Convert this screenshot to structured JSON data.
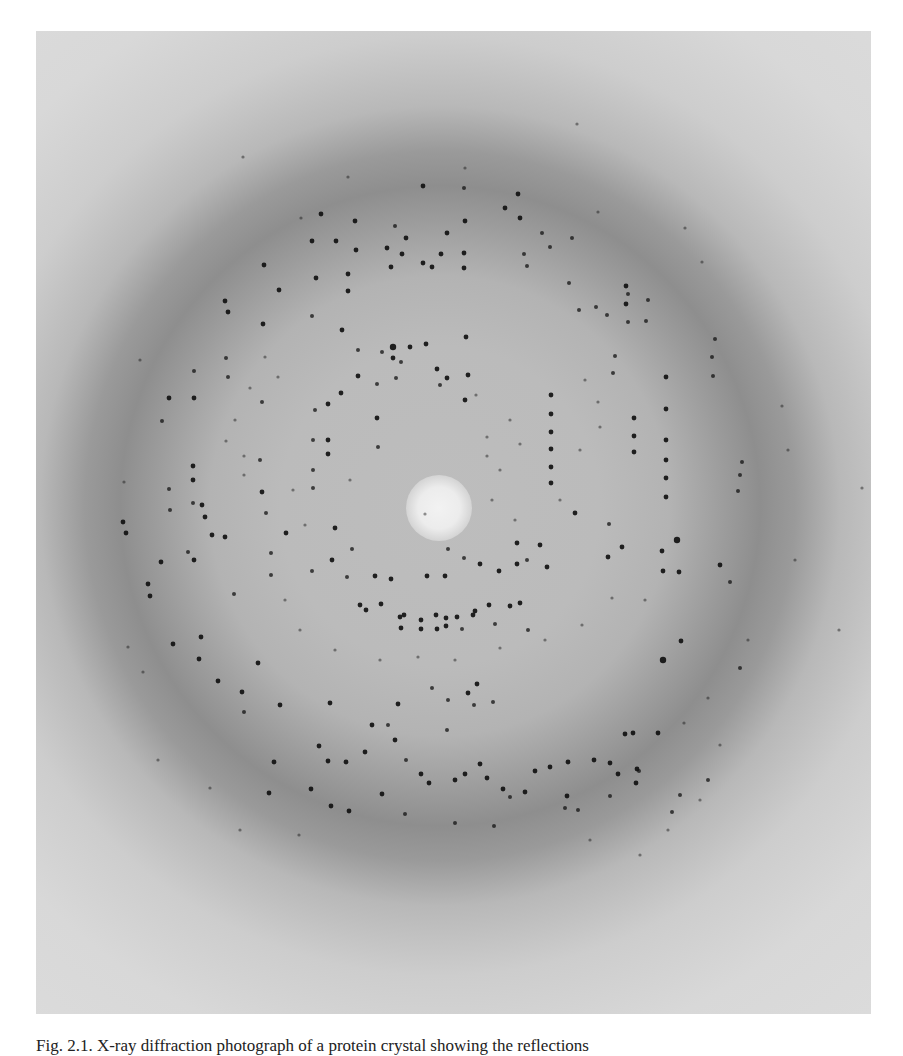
{
  "figure": {
    "kind": "x-ray-diffraction-photograph",
    "background_colors": {
      "paper": "#ffffff",
      "outer": "#dcdcdc",
      "ring": "#8e8e8e",
      "inner": "#bcbcbc",
      "beamstop": "#f0f0f0",
      "spot": "#111111"
    },
    "center": [
      404,
      475
    ]
  },
  "caption": {
    "text": "Fig. 2.1. X-ray diffraction photograph of a protein crystal showing the reflections"
  },
  "spots": [
    [
      393,
      347,
      4
    ],
    [
      393,
      358,
      3
    ],
    [
      358,
      376,
      3
    ],
    [
      341,
      393,
      3
    ],
    [
      328,
      404,
      3
    ],
    [
      328,
      440,
      3
    ],
    [
      328,
      454,
      3
    ],
    [
      410,
      347,
      3
    ],
    [
      426,
      344,
      3
    ],
    [
      437,
      369,
      3
    ],
    [
      447,
      378,
      3
    ],
    [
      440,
      385,
      2.5
    ],
    [
      466,
      337,
      3
    ],
    [
      468,
      375,
      3
    ],
    [
      465,
      400,
      3
    ],
    [
      382,
      352,
      2.5
    ],
    [
      377,
      384,
      2.5
    ],
    [
      377,
      418,
      3
    ],
    [
      378,
      447,
      2.5
    ],
    [
      315,
      410,
      2.5
    ],
    [
      313,
      440,
      2.5
    ],
    [
      313,
      470,
      2.5
    ],
    [
      313,
      488,
      2.5
    ],
    [
      401,
      362,
      2.5
    ],
    [
      396,
      378,
      2.5
    ],
    [
      551,
      395,
      3
    ],
    [
      551,
      414,
      3
    ],
    [
      551,
      432,
      3
    ],
    [
      551,
      449,
      3
    ],
    [
      551,
      467,
      3
    ],
    [
      551,
      483,
      3
    ],
    [
      634,
      418,
      3
    ],
    [
      634,
      436,
      3
    ],
    [
      634,
      452,
      3
    ],
    [
      666,
      377,
      3
    ],
    [
      666,
      409,
      3
    ],
    [
      666,
      440,
      3
    ],
    [
      666,
      460,
      3
    ],
    [
      666,
      478,
      3
    ],
    [
      666,
      497,
      3
    ],
    [
      740,
      475,
      2.5
    ],
    [
      738,
      491,
      2.5
    ],
    [
      742,
      462,
      2.5
    ],
    [
      596,
      307,
      2.5
    ],
    [
      628,
      294,
      2.5
    ],
    [
      628,
      322,
      2.5
    ],
    [
      715,
      339,
      2.5
    ],
    [
      712,
      357,
      2.5
    ],
    [
      713,
      376,
      2.5
    ],
    [
      615,
      356,
      2.5
    ],
    [
      613,
      373,
      2.5
    ],
    [
      646,
      321,
      2.5
    ],
    [
      648,
      300,
      2.5
    ],
    [
      355,
      221,
      3
    ],
    [
      395,
      226,
      2.5
    ],
    [
      423,
      186,
      3
    ],
    [
      464,
      188,
      2.5
    ],
    [
      321,
      214,
      3
    ],
    [
      312,
      241,
      3
    ],
    [
      336,
      241,
      3
    ],
    [
      356,
      250,
      3
    ],
    [
      387,
      248,
      3
    ],
    [
      402,
      254,
      3
    ],
    [
      406,
      238,
      3
    ],
    [
      423,
      263,
      3
    ],
    [
      441,
      254,
      3
    ],
    [
      432,
      267,
      3
    ],
    [
      447,
      233,
      3
    ],
    [
      464,
      253,
      3
    ],
    [
      464,
      268,
      3
    ],
    [
      391,
      267,
      3
    ],
    [
      465,
      221,
      3
    ],
    [
      520,
      218,
      3
    ],
    [
      518,
      194,
      3
    ],
    [
      542,
      233,
      2.5
    ],
    [
      550,
      247,
      2.5
    ],
    [
      505,
      208,
      3
    ],
    [
      524,
      254,
      2.5
    ],
    [
      572,
      238,
      2.5
    ],
    [
      527,
      266,
      2.5
    ],
    [
      569,
      283,
      2.5
    ],
    [
      264,
      265,
      3
    ],
    [
      225,
      301,
      3
    ],
    [
      279,
      290,
      3
    ],
    [
      316,
      278,
      3
    ],
    [
      348,
      274,
      3
    ],
    [
      348,
      291,
      3
    ],
    [
      228,
      312,
      3
    ],
    [
      263,
      324,
      3
    ],
    [
      312,
      316,
      2.5
    ],
    [
      342,
      330,
      3
    ],
    [
      358,
      350,
      2.5
    ],
    [
      626,
      286,
      3
    ],
    [
      626,
      304,
      3
    ],
    [
      607,
      315,
      2.5
    ],
    [
      579,
      310,
      2.5
    ],
    [
      194,
      371,
      2.5
    ],
    [
      194,
      398,
      3
    ],
    [
      169,
      398,
      3
    ],
    [
      162,
      421,
      2.5
    ],
    [
      226,
      358,
      2.5
    ],
    [
      228,
      377,
      2.5
    ],
    [
      262,
      402,
      2.5
    ],
    [
      193,
      466,
      3
    ],
    [
      193,
      480,
      3
    ],
    [
      193,
      503,
      2.5
    ],
    [
      169,
      489,
      2.5
    ],
    [
      170,
      510,
      2.5
    ],
    [
      202,
      505,
      3
    ],
    [
      205,
      517,
      3
    ],
    [
      260,
      460,
      2.5
    ],
    [
      262,
      492,
      3
    ],
    [
      266,
      513,
      2.5
    ],
    [
      123,
      522,
      3
    ],
    [
      126,
      533,
      3
    ],
    [
      148,
      584,
      3
    ],
    [
      150,
      596,
      3
    ],
    [
      161,
      562,
      3
    ],
    [
      194,
      560,
      3
    ],
    [
      212,
      535,
      3
    ],
    [
      234,
      594,
      2.5
    ],
    [
      271,
      553,
      2.5
    ],
    [
      271,
      575,
      2.5
    ],
    [
      188,
      552,
      2.5
    ],
    [
      225,
      537,
      3
    ],
    [
      286,
      533,
      3
    ],
    [
      335,
      528,
      3
    ],
    [
      352,
      549,
      2.5
    ],
    [
      332,
      560,
      3
    ],
    [
      312,
      571,
      2.5
    ],
    [
      347,
      577,
      2.5
    ],
    [
      375,
      576,
      3
    ],
    [
      391,
      579,
      3
    ],
    [
      427,
      576,
      3
    ],
    [
      445,
      576,
      3
    ],
    [
      480,
      564,
      3
    ],
    [
      517,
      564,
      3
    ],
    [
      527,
      560,
      2.5
    ],
    [
      540,
      545,
      3
    ],
    [
      547,
      567,
      3
    ],
    [
      517,
      543,
      3
    ],
    [
      464,
      558,
      2.5
    ],
    [
      448,
      549,
      2.5
    ],
    [
      499,
      571,
      3
    ],
    [
      360,
      605,
      3
    ],
    [
      366,
      610,
      3
    ],
    [
      381,
      604,
      3
    ],
    [
      400,
      617,
      3
    ],
    [
      404,
      615,
      3
    ],
    [
      421,
      620,
      3
    ],
    [
      436,
      615,
      3
    ],
    [
      446,
      618,
      3
    ],
    [
      457,
      617,
      3
    ],
    [
      473,
      615,
      3
    ],
    [
      475,
      611,
      3
    ],
    [
      489,
      605,
      3
    ],
    [
      510,
      606,
      3
    ],
    [
      520,
      603,
      3
    ],
    [
      401,
      628,
      3
    ],
    [
      421,
      629,
      3
    ],
    [
      437,
      629,
      3
    ],
    [
      446,
      626,
      3
    ],
    [
      462,
      629,
      2.5
    ],
    [
      495,
      624,
      2.5
    ],
    [
      528,
      630,
      2.5
    ],
    [
      575,
      513,
      3
    ],
    [
      609,
      524,
      2.5
    ],
    [
      622,
      547,
      3
    ],
    [
      662,
      551,
      3
    ],
    [
      608,
      557,
      3
    ],
    [
      663,
      571,
      3
    ],
    [
      677,
      540,
      4
    ],
    [
      679,
      572,
      3
    ],
    [
      720,
      565,
      3
    ],
    [
      681,
      641,
      3
    ],
    [
      663,
      660,
      4
    ],
    [
      730,
      582,
      2.5
    ],
    [
      740,
      668,
      2.5
    ],
    [
      199,
      659,
      3
    ],
    [
      218,
      681,
      3
    ],
    [
      258,
      663,
      3
    ],
    [
      201,
      637,
      3
    ],
    [
      173,
      644,
      3
    ],
    [
      242,
      692,
      3
    ],
    [
      280,
      705,
      3
    ],
    [
      330,
      703,
      3
    ],
    [
      244,
      712,
      2.5
    ],
    [
      319,
      746,
      3
    ],
    [
      328,
      761,
      3
    ],
    [
      346,
      762,
      3
    ],
    [
      365,
      752,
      3
    ],
    [
      372,
      725,
      3
    ],
    [
      395,
      740,
      3
    ],
    [
      406,
      760,
      2.5
    ],
    [
      421,
      774,
      3
    ],
    [
      429,
      783,
      3
    ],
    [
      455,
      780,
      3
    ],
    [
      465,
      774,
      3
    ],
    [
      480,
      764,
      3
    ],
    [
      487,
      778,
      3
    ],
    [
      503,
      789,
      3
    ],
    [
      525,
      792,
      3
    ],
    [
      535,
      771,
      3
    ],
    [
      550,
      767,
      3
    ],
    [
      568,
      762,
      3
    ],
    [
      594,
      760,
      3
    ],
    [
      610,
      763,
      3
    ],
    [
      618,
      774,
      3
    ],
    [
      625,
      734,
      3
    ],
    [
      633,
      733,
      3
    ],
    [
      658,
      733,
      3
    ],
    [
      637,
      769,
      3
    ],
    [
      567,
      796,
      3
    ],
    [
      468,
      693,
      3
    ],
    [
      477,
      684,
      3
    ],
    [
      493,
      702,
      2.5
    ],
    [
      398,
      704,
      3
    ],
    [
      432,
      688,
      2.5
    ],
    [
      448,
      700,
      2.5
    ],
    [
      388,
      725,
      2.5
    ],
    [
      447,
      730,
      2.5
    ],
    [
      474,
      705,
      2.5
    ],
    [
      274,
      762,
      3
    ],
    [
      269,
      793,
      3
    ],
    [
      311,
      789,
      3
    ],
    [
      331,
      806,
      3
    ],
    [
      349,
      811,
      3
    ],
    [
      382,
      794,
      3
    ],
    [
      405,
      814,
      2.5
    ],
    [
      455,
      823,
      2.5
    ],
    [
      494,
      826,
      2.5
    ],
    [
      510,
      797,
      2.5
    ],
    [
      565,
      808,
      2.5
    ],
    [
      578,
      810,
      2.5
    ],
    [
      639,
      771,
      2.5
    ],
    [
      636,
      783,
      3
    ],
    [
      672,
      812,
      2.5
    ],
    [
      708,
      780,
      2.5
    ],
    [
      680,
      795,
      2.5
    ],
    [
      610,
      796,
      2.5
    ],
    [
      243,
      157,
      2
    ],
    [
      301,
      218,
      2
    ],
    [
      348,
      177,
      2
    ],
    [
      465,
      168,
      2
    ],
    [
      577,
      124,
      2
    ],
    [
      598,
      212,
      2
    ],
    [
      685,
      228,
      2
    ],
    [
      702,
      262,
      2
    ],
    [
      140,
      360,
      2
    ],
    [
      124,
      482,
      2
    ],
    [
      128,
      647,
      2
    ],
    [
      143,
      672,
      2
    ],
    [
      158,
      760,
      2
    ],
    [
      862,
      488,
      2
    ],
    [
      839,
      630,
      2
    ],
    [
      708,
      698,
      2
    ],
    [
      684,
      723,
      2
    ],
    [
      720,
      745,
      2
    ],
    [
      748,
      640,
      2
    ],
    [
      795,
      560,
      2
    ],
    [
      788,
      450,
      2
    ],
    [
      782,
      406,
      2
    ],
    [
      210,
      788,
      2
    ],
    [
      240,
      830,
      2
    ],
    [
      299,
      835,
      2
    ],
    [
      590,
      840,
      2
    ],
    [
      640,
      855,
      2
    ],
    [
      668,
      830,
      2
    ],
    [
      700,
      800,
      2
    ],
    [
      235,
      420,
      2
    ],
    [
      244,
      456,
      2
    ],
    [
      244,
      475,
      2
    ],
    [
      226,
      441,
      2
    ],
    [
      265,
      357,
      2
    ],
    [
      278,
      377,
      2
    ],
    [
      250,
      388,
      2
    ],
    [
      510,
      420,
      2
    ],
    [
      520,
      444,
      2
    ],
    [
      500,
      470,
      2
    ],
    [
      492,
      500,
      2
    ],
    [
      515,
      520,
      2
    ],
    [
      560,
      500,
      2
    ],
    [
      580,
      450,
      2
    ],
    [
      598,
      402,
      2
    ],
    [
      600,
      427,
      2
    ],
    [
      585,
      380,
      2
    ],
    [
      476,
      395,
      2
    ],
    [
      487,
      437,
      2
    ],
    [
      487,
      456,
      2
    ],
    [
      425,
      514,
      2
    ],
    [
      350,
      480,
      2
    ],
    [
      293,
      490,
      2
    ],
    [
      305,
      525,
      2
    ],
    [
      285,
      600,
      2
    ],
    [
      300,
      630,
      2
    ],
    [
      335,
      650,
      2
    ],
    [
      380,
      660,
      2
    ],
    [
      418,
      657,
      2
    ],
    [
      455,
      660,
      2
    ],
    [
      500,
      648,
      2
    ],
    [
      545,
      640,
      2
    ],
    [
      582,
      625,
      2
    ],
    [
      612,
      598,
      2
    ],
    [
      645,
      600,
      2
    ]
  ]
}
